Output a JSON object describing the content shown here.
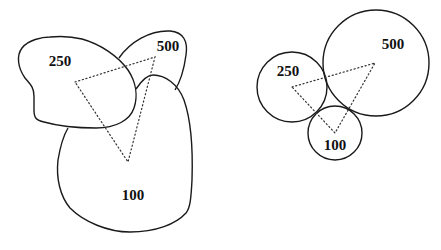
{
  "diagram": {
    "colors": {
      "background": "#ffffff",
      "stroke": "#1a1a1a",
      "dotted": "#333333",
      "text": "#111111"
    },
    "left_figure": {
      "name": "irregular-blobs",
      "regions": [
        {
          "id": "blob-250",
          "label": "250",
          "label_pos": [
            60,
            63
          ]
        },
        {
          "id": "blob-500",
          "label": "500",
          "label_pos": [
            168,
            48
          ]
        },
        {
          "id": "blob-100",
          "label": "100",
          "label_pos": [
            133,
            197
          ]
        }
      ],
      "triangle": [
        [
          75,
          82
        ],
        [
          155,
          57
        ],
        [
          128,
          162
        ]
      ]
    },
    "right_figure": {
      "name": "proportional-circles",
      "circles": [
        {
          "id": "circle-250",
          "label": "250",
          "cx": 292,
          "cy": 87,
          "r": 35,
          "label_pos": [
            288,
            73
          ]
        },
        {
          "id": "circle-500",
          "label": "500",
          "cx": 376,
          "cy": 63,
          "r": 53,
          "label_pos": [
            393,
            46
          ]
        },
        {
          "id": "circle-100",
          "label": "100",
          "cx": 335,
          "cy": 133,
          "r": 27,
          "label_pos": [
            335,
            147
          ]
        }
      ],
      "triangle": [
        [
          292,
          87
        ],
        [
          375,
          63
        ],
        [
          335,
          133
        ]
      ]
    }
  }
}
